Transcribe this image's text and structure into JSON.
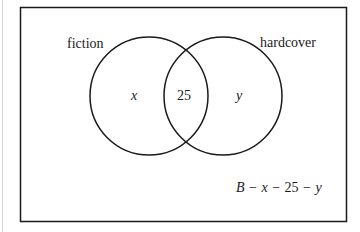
{
  "diagram": {
    "type": "venn",
    "universe_label": "B - x - 25 - y",
    "sets": [
      {
        "name": "fiction",
        "label": "fiction",
        "only_value": "x"
      },
      {
        "name": "hardcover",
        "label": "hardcover",
        "only_value": "y"
      }
    ],
    "intersection_value": "25",
    "outside_expression": {
      "B": "B",
      "minus1": "−",
      "x": "x",
      "minus2": "−",
      "n25": "25",
      "minus3": "−",
      "y": "y"
    }
  }
}
